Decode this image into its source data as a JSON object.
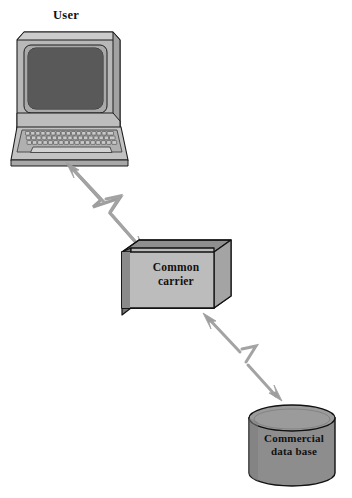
{
  "diagram": {
    "background_color": "#ffffff",
    "nodes": [
      {
        "id": "user",
        "label": "User",
        "shape": "computer-terminal",
        "icon": "computer-terminal-icon",
        "label_position": "above",
        "fill_color": "#b3b3b3",
        "screen_color": "#585858",
        "outline_color": "#1a1a1a"
      },
      {
        "id": "common-carrier",
        "label_line1": "Common",
        "label_line2": "carrier",
        "label": "Common carrier",
        "shape": "3d-box",
        "icon": "box-3d-icon",
        "label_position": "inside",
        "front_fill": "#b9b9b9",
        "top_fill": "#8f8f8f",
        "side_fill": "#757575",
        "outline_color": "#111111"
      },
      {
        "id": "commercial-data-base",
        "label_line1": "Commercial",
        "label_line2": "data base",
        "label": "Commercial data base",
        "shape": "cylinder",
        "icon": "database-cylinder-icon",
        "label_position": "inside",
        "body_fill": "#8d8d8d",
        "top_fill": "#9a9a9a",
        "outline_color": "#111111"
      }
    ],
    "connectors": [
      {
        "id": "user-to-carrier",
        "from": "user",
        "to": "common-carrier",
        "style": "lightning-bolt",
        "direction": "bidirectional",
        "arrowheads": "both",
        "color": "#9a9a9a"
      },
      {
        "id": "carrier-to-database",
        "from": "common-carrier",
        "to": "commercial-data-base",
        "style": "lightning-bolt",
        "direction": "bidirectional",
        "arrowheads": "both",
        "color": "#9a9a9a"
      }
    ]
  }
}
